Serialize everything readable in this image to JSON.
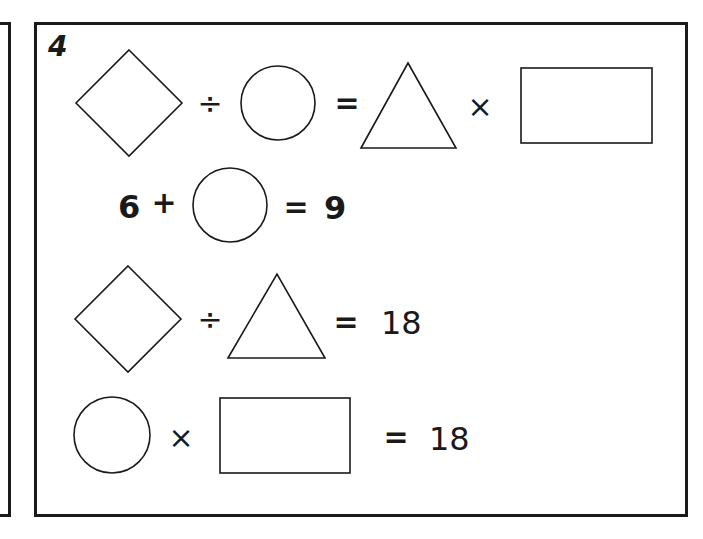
{
  "worksheet": {
    "problem_number": "4",
    "equations": [
      {
        "id": "eq1",
        "description": "diamond ÷ circle = triangle × rectangle",
        "op1": "÷",
        "eq": "=",
        "op2": "×"
      },
      {
        "id": "eq2",
        "description": "6 + circle = 9",
        "lhs_number": "6",
        "op1": "+",
        "eq": "=",
        "result": "9"
      },
      {
        "id": "eq3",
        "description": "diamond ÷ triangle = 18",
        "op1": "÷",
        "eq": "=",
        "result": "18"
      },
      {
        "id": "eq4",
        "description": "circle × rectangle = 18",
        "op1": "×",
        "eq": "=",
        "result": "18"
      }
    ],
    "colors": {
      "ink": "#1a1a1a",
      "background": "#ffffff"
    }
  }
}
